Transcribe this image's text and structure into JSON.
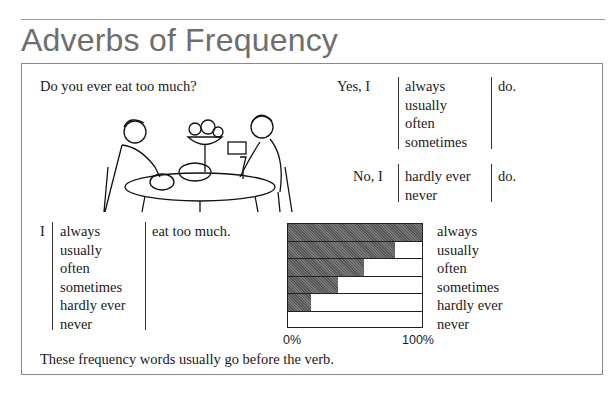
{
  "header": {
    "title": "Adverbs of Frequency"
  },
  "question": "Do you ever eat too much?",
  "answers": {
    "yes_prefix": "Yes, I",
    "yes_adverbs": [
      "always",
      "usually",
      "often",
      "sometimes"
    ],
    "yes_suffix": "do.",
    "no_prefix": "No, I",
    "no_adverbs": [
      "hardly ever",
      "never"
    ],
    "no_suffix": "do."
  },
  "statement": {
    "subject": "I",
    "adverbs": [
      "always",
      "usually",
      "often",
      "sometimes",
      "hardly ever",
      "never"
    ],
    "predicate": "eat too much."
  },
  "note": "These frequency words usually go before the verb.",
  "illustration": {
    "description": "man and woman eating a large meal at a table"
  },
  "chart_data": {
    "type": "bar",
    "orientation": "horizontal",
    "categories": [
      "always",
      "usually",
      "often",
      "sometimes",
      "hardly ever",
      "never"
    ],
    "values": [
      100,
      80,
      57,
      37,
      17,
      0
    ],
    "title": "",
    "xlabel": "",
    "ylabel": "",
    "xlim": [
      0,
      100
    ],
    "tick_labels": [
      "0%",
      "100%"
    ],
    "legend": "category labels on right",
    "grid": false
  }
}
